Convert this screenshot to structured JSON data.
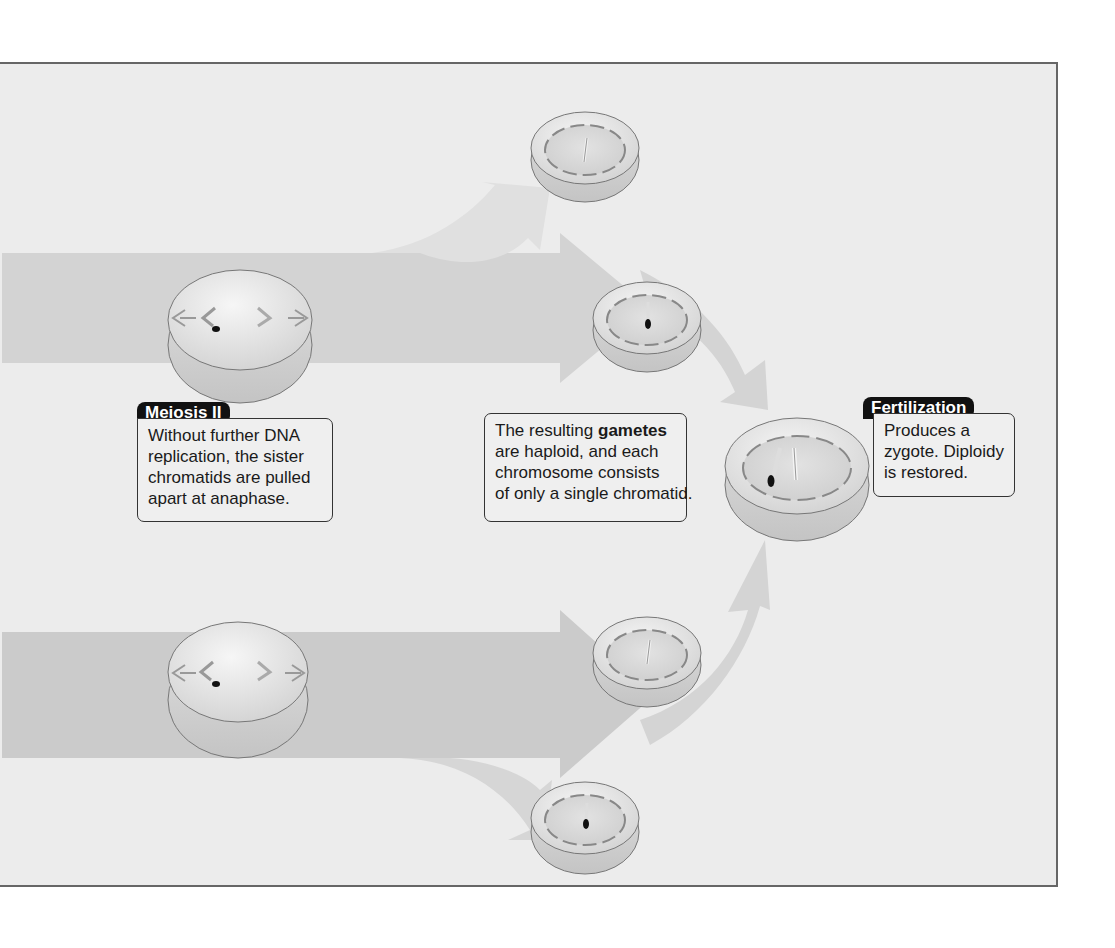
{
  "colors": {
    "panel_bg": "#ececec",
    "panel_border": "#666666",
    "arrow_dark": "#c8c8c8",
    "arrow_light": "#dadada",
    "cell_fill": "#e4e4e4",
    "tag_bg": "#111111"
  },
  "meiosis2": {
    "tag": "Meiosis II",
    "lines": [
      "Without further DNA",
      "replication, the sister",
      "chromatids are pulled",
      "apart at anaphase."
    ]
  },
  "gametes": {
    "line1_pre": "The resulting ",
    "line1_bold": "gametes",
    "lines": [
      "are haploid, and each",
      "chromosome consists",
      "of only a single chromatid."
    ]
  },
  "fertilization": {
    "tag": "Fertilization",
    "lines": [
      "Produces a",
      "zygote. Diploidy",
      "is restored."
    ]
  },
  "cells": [
    {
      "name": "meiosis2-cell-top",
      "stage": "anaphase II"
    },
    {
      "name": "meiosis2-cell-bottom",
      "stage": "anaphase II"
    },
    {
      "name": "gamete-1"
    },
    {
      "name": "gamete-2"
    },
    {
      "name": "gamete-3"
    },
    {
      "name": "gamete-4"
    },
    {
      "name": "zygote"
    }
  ]
}
